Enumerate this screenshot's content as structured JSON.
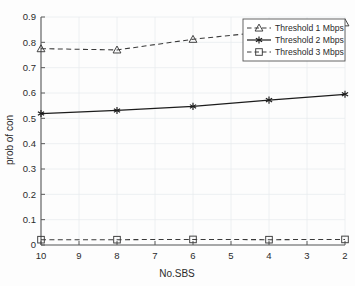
{
  "chart_data": {
    "type": "line",
    "title": "",
    "xlabel": "No.SBS",
    "ylabel": "prob of con",
    "x": [
      10,
      8,
      6,
      4,
      2
    ],
    "xtick_labels": [
      "10",
      "9",
      "8",
      "7",
      "6",
      "5",
      "4",
      "3",
      "2"
    ],
    "xticks": [
      10,
      9,
      8,
      7,
      6,
      5,
      4,
      3,
      2
    ],
    "xlim": [
      10,
      2
    ],
    "x_reversed": true,
    "ytick_labels": [
      "0",
      "0.1",
      "0.2",
      "0.3",
      "0.4",
      "0.5",
      "0.6",
      "0.7",
      "0.8",
      "0.9"
    ],
    "yticks": [
      0,
      0.1,
      0.2,
      0.3,
      0.4,
      0.5,
      0.6,
      0.7,
      0.8,
      0.9
    ],
    "ylim": [
      0,
      0.9
    ],
    "grid": true,
    "legend_position": "top-right",
    "series": [
      {
        "name": "Threshold 1 Mbps",
        "values": [
          0.775,
          0.77,
          0.812,
          0.843,
          0.877
        ],
        "marker": "triangle",
        "linestyle": "dashed",
        "color": "#3a3a3a"
      },
      {
        "name": "Threshold 2 Mbps",
        "values": [
          0.519,
          0.531,
          0.547,
          0.572,
          0.595
        ],
        "marker": "asterisk",
        "linestyle": "solid",
        "color": "#1c1c1c"
      },
      {
        "name": "Threshold 3 Mbps",
        "values": [
          0.021,
          0.021,
          0.022,
          0.021,
          0.022
        ],
        "marker": "square",
        "linestyle": "dashed",
        "color": "#3a3a3a"
      }
    ]
  },
  "legend": {
    "items": [
      {
        "label": "Threshold 1 Mbps"
      },
      {
        "label": "Threshold 2 Mbps"
      },
      {
        "label": "Threshold 3 Mbps"
      }
    ]
  },
  "axes": {
    "x_title": "No.SBS",
    "y_title": "prob of con"
  },
  "colors": {
    "axis": "#5a5a5a",
    "grid": "#e8ecef",
    "text": "#2b2b2b",
    "line_dashed": "#3a3a3a",
    "line_solid": "#1c1c1c",
    "background": "#fdfdfd",
    "legend_border": "#555555"
  }
}
